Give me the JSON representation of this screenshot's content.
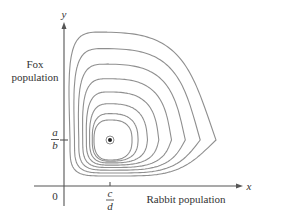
{
  "figure": {
    "y_axis_label": "y",
    "x_axis_label": "x",
    "y_axis_title_line1": "Fox",
    "y_axis_title_line2": "population",
    "x_axis_title": "Rabbit population",
    "origin_label": "0",
    "y_tick_numerator": "a",
    "y_tick_denominator": "b",
    "x_tick_numerator": "c",
    "x_tick_denominator": "d",
    "equilibrium_point": "equilibrium (c/d, a/b)",
    "curve_count": 8,
    "colors": {
      "curve": "#8f8f8f",
      "axis": "#555555",
      "text": "#333333"
    }
  }
}
